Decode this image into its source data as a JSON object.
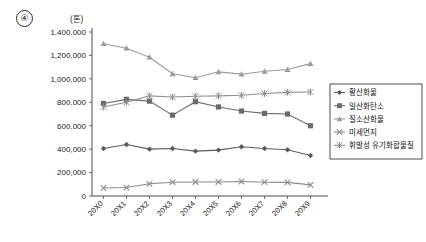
{
  "figure": {
    "number_marker": "④",
    "unit_label": "(톤)"
  },
  "chart_data": {
    "type": "line",
    "title": "",
    "xlabel": "",
    "ylabel": "",
    "unit": "톤",
    "ylim": [
      0,
      1400000
    ],
    "ytick_step": 200000,
    "grid": false,
    "legend_position": "right",
    "categories": [
      "20X0",
      "20X1",
      "20X2",
      "20X3",
      "20X4",
      "20X5",
      "20X6",
      "20X7",
      "20X8",
      "20X9"
    ],
    "ytick_labels": [
      "0",
      "200,000",
      "400,000",
      "600,000",
      "800,000",
      "1,000,000",
      "1,200,000",
      "1,400,000"
    ],
    "ytick_values": [
      0,
      200000,
      400000,
      600000,
      800000,
      1000000,
      1200000,
      1400000
    ],
    "series": [
      {
        "name": "황산화물",
        "marker": "diamond",
        "color": "#5a5a5a",
        "values": [
          405000,
          440000,
          400000,
          405000,
          383000,
          392000,
          420000,
          405000,
          395000,
          345000
        ]
      },
      {
        "name": "일산화탄소",
        "marker": "square",
        "color": "#6b6b6b",
        "values": [
          790000,
          825000,
          810000,
          690000,
          805000,
          760000,
          725000,
          705000,
          700000,
          600000
        ]
      },
      {
        "name": "질소산화물",
        "marker": "triangle",
        "color": "#9a9a9a",
        "values": [
          1300000,
          1262000,
          1185000,
          1043000,
          1010000,
          1060000,
          1040000,
          1065000,
          1080000,
          1130000
        ]
      },
      {
        "name": "미세먼지",
        "marker": "x",
        "color": "#8a8a8a",
        "values": [
          68000,
          72000,
          104000,
          118000,
          120000,
          120000,
          124000,
          118000,
          116000,
          95000
        ]
      },
      {
        "name": "휘발성 유기화합물질",
        "marker": "asterisk",
        "color": "#8f8f8f",
        "values": [
          760000,
          800000,
          855000,
          845000,
          852000,
          855000,
          860000,
          875000,
          885000,
          888000
        ]
      }
    ]
  },
  "legend": {
    "items": [
      {
        "label": "황산화물"
      },
      {
        "label": "일산화탄소"
      },
      {
        "label": "질소산화물"
      },
      {
        "label": "미세먼지"
      },
      {
        "label": "휘발성 유기화합물질"
      }
    ]
  }
}
